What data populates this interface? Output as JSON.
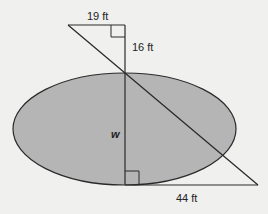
{
  "diagram": {
    "type": "geometry-similar-triangles",
    "shape": "ellipse (pond)",
    "colors": {
      "background": "#f0f0ef",
      "ellipse_fill": "#b5b5b5",
      "stroke": "#2a2a2a"
    },
    "labels": {
      "top_leg": "19 ft",
      "upper_vertical": "16 ft",
      "width_variable": "w",
      "bottom_leg": "44 ft"
    },
    "right_angles": 2
  }
}
